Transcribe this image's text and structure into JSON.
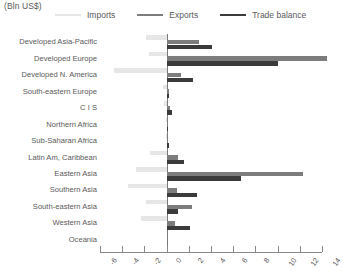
{
  "units_label": "(Bln US$)",
  "legend": {
    "position": "top",
    "items": [
      {
        "label": "Imports",
        "color": "#e6e6e6",
        "name": "legend-imports"
      },
      {
        "label": "Exports",
        "color": "#7d7d7d",
        "name": "legend-exports"
      },
      {
        "label": "Trade balance",
        "color": "#3b3b3b",
        "name": "legend-trade-balance"
      }
    ]
  },
  "chart_data": {
    "type": "bar",
    "orientation": "horizontal",
    "title": "",
    "subtitle": "",
    "xlabel": "(Bln US$)",
    "ylabel": "",
    "grid": false,
    "legend_position": "top",
    "xlim": [
      -6,
      14
    ],
    "xticks": [
      -6,
      -4,
      -2,
      0,
      2,
      4,
      6,
      8,
      10,
      12,
      14
    ],
    "xtick_labels": [
      "-6",
      "-4",
      "-2",
      "0",
      "2",
      "4",
      "6",
      "8",
      "10",
      "12",
      "14"
    ],
    "categories": [
      "Developed Asia-Pacific",
      "Developed Europe",
      "Developed N. America",
      "South-eastern Europe",
      "C I S",
      "Northern Africa",
      "Sub-Saharan Africa",
      "Latin Am, Caribbean",
      "Eastern Asia",
      "Southern Asia",
      "South-eastern Asia",
      "Western Asia",
      "Oceania"
    ],
    "series": [
      {
        "name": "Imports",
        "color": "#e6e6e6",
        "values": [
          -1.9,
          -1.6,
          -4.7,
          -0.3,
          -0.2,
          -0.1,
          -0.1,
          -1.5,
          -2.8,
          -3.5,
          -1.9,
          -2.3,
          0.0
        ]
      },
      {
        "name": "Exports",
        "color": "#7d7d7d",
        "values": [
          2.9,
          14.5,
          1.3,
          0.2,
          0.3,
          0.1,
          0.1,
          1.0,
          12.3,
          0.9,
          2.3,
          0.8,
          0.0
        ]
      },
      {
        "name": "Trade balance",
        "color": "#3b3b3b",
        "values": [
          4.1,
          10.0,
          2.4,
          0.2,
          0.5,
          0.1,
          0.2,
          1.6,
          6.7,
          2.7,
          1.0,
          2.1,
          0.0
        ]
      }
    ]
  }
}
